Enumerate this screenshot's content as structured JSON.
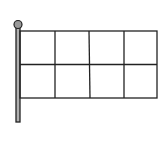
{
  "illustration": {
    "subject": "flag on pole",
    "grid": {
      "rows": 2,
      "cols": 4
    },
    "colors": {
      "stroke": "#222222",
      "pole_fill": "#b0b0b0",
      "background": "#ffffff"
    }
  }
}
